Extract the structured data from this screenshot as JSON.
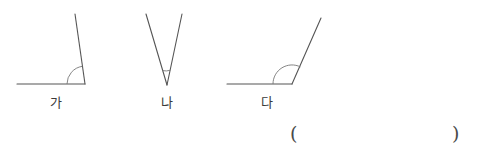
{
  "page": {
    "background_color": "#ffffff",
    "stroke_color": "#555555",
    "text_color": "#3a3a3a",
    "width": 489,
    "height": 157
  },
  "figures": [
    {
      "id": "ga",
      "label": "가",
      "description": "acute-to-right angle opening upward-left from vertex",
      "vertex": {
        "x": 85,
        "y": 84
      },
      "horizontal_ray_end": {
        "x": 17,
        "y": 84
      },
      "slanted_ray_end": {
        "x": 75,
        "y": 14
      },
      "arc_radius": 18,
      "angle_degrees": 82
    },
    {
      "id": "na",
      "label": "나",
      "description": "narrow V shape with small acute angle at bottom vertex",
      "vertex": {
        "x": 167,
        "y": 85
      },
      "left_ray_end": {
        "x": 146,
        "y": 14
      },
      "right_ray_end": {
        "x": 182,
        "y": 14
      },
      "arc_radius": 15,
      "angle_degrees": 28
    },
    {
      "id": "da",
      "label": "다",
      "description": "obtuse angle opening upward-right from vertex",
      "vertex": {
        "x": 292,
        "y": 84
      },
      "horizontal_ray_end": {
        "x": 227,
        "y": 84
      },
      "slanted_ray_end": {
        "x": 321,
        "y": 18
      },
      "arc_radius": 19,
      "angle_degrees": 125
    }
  ],
  "answer_blank": {
    "open_paren": "(",
    "close_paren": ")",
    "value": ""
  }
}
